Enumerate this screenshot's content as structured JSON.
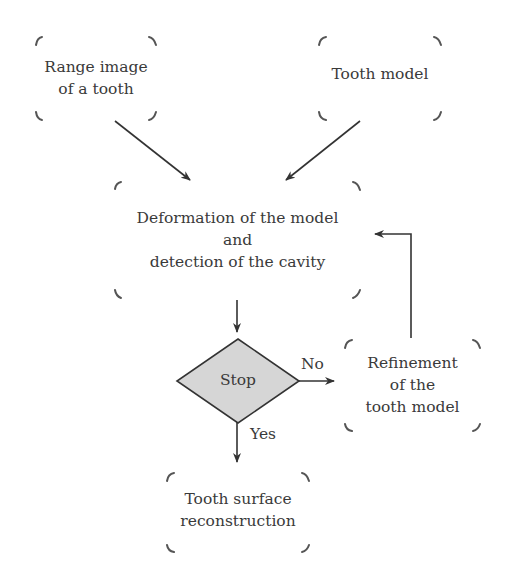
{
  "diagram": {
    "type": "flowchart",
    "nodes": {
      "range_image": {
        "lines": [
          "Range image",
          "of a tooth"
        ]
      },
      "tooth_model": {
        "lines": [
          "Tooth model"
        ]
      },
      "deformation": {
        "lines": [
          "Deformation of the model",
          "and",
          "detection of the cavity"
        ]
      },
      "stop": {
        "label": "Stop",
        "shape": "diamond",
        "fill": "#d6d6d6"
      },
      "refinement": {
        "lines": [
          "Refinement",
          "of the",
          "tooth model"
        ]
      },
      "reconstruction": {
        "lines": [
          "Tooth surface",
          "reconstruction"
        ]
      }
    },
    "edges": [
      {
        "from": "range_image",
        "to": "deformation",
        "label": ""
      },
      {
        "from": "tooth_model",
        "to": "deformation",
        "label": ""
      },
      {
        "from": "deformation",
        "to": "stop",
        "label": ""
      },
      {
        "from": "stop",
        "to": "refinement",
        "label": "No"
      },
      {
        "from": "refinement",
        "to": "deformation",
        "label": ""
      },
      {
        "from": "stop",
        "to": "reconstruction",
        "label": "Yes"
      }
    ],
    "edge_labels": {
      "no": "No",
      "yes": "Yes"
    },
    "colors": {
      "stroke": "#333333",
      "bracket": "#555555",
      "diamond_fill": "#d6d6d6",
      "text": "#3a3a3a"
    }
  }
}
